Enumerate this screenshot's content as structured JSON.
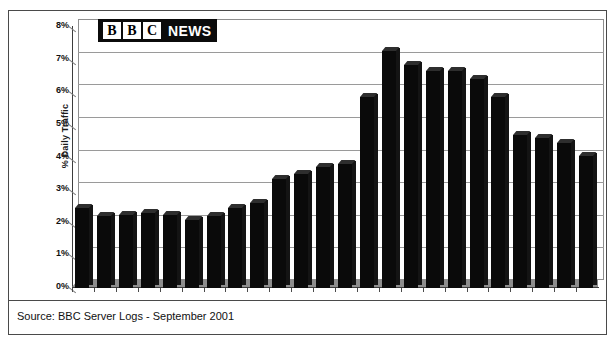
{
  "logo": {
    "letters": [
      "B",
      "B",
      "C"
    ],
    "word": "NEWS",
    "name": "bbc-news-logo"
  },
  "footer": {
    "source": "Source: BBC Server Logs - September 2001"
  },
  "chart_data": {
    "type": "bar",
    "title": "",
    "xlabel": "",
    "ylabel": "% Daily Traffic",
    "ylim": [
      0,
      8
    ],
    "ytick_labels": [
      "8%",
      "7%",
      "6%",
      "5%",
      "4%",
      "3%",
      "2%",
      "1%",
      "0%"
    ],
    "ytick_values": [
      8,
      7,
      6,
      5,
      4,
      3,
      2,
      1,
      0
    ],
    "grid": true,
    "legend": "none",
    "bar_color": "#0a0a0a",
    "categories": [
      "00:00",
      "01:00",
      "02:00",
      "03:00",
      "04:00",
      "05:00",
      "06:00",
      "07:00",
      "08:00",
      "09:00",
      "10:00",
      "11:00",
      "12:00",
      "13:00",
      "14:00",
      "15:00",
      "16:00",
      "17:00",
      "18:00",
      "19:00",
      "20:00",
      "21:00",
      "22:00",
      "23:00"
    ],
    "values": [
      2.45,
      2.2,
      2.25,
      2.3,
      2.25,
      2.1,
      2.2,
      2.45,
      2.6,
      3.35,
      3.5,
      3.7,
      3.8,
      5.85,
      7.25,
      6.85,
      6.65,
      6.65,
      6.4,
      5.85,
      4.7,
      4.6,
      4.45,
      4.05
    ]
  }
}
